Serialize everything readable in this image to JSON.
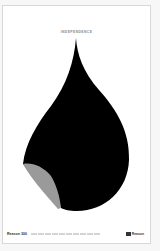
{
  "poster": {
    "title": "INDEPENDENCE",
    "artwork": {
      "subject": "ink-drop-with-peeling-corner",
      "drop_color": "#000000",
      "peel_color": "#9a9a9a",
      "background_color": "#ffffff"
    },
    "footer": {
      "left_label": "Reason 300",
      "fine_print": "",
      "right_logo_icon": "logo-mark-icon",
      "right_label": "Reason"
    }
  },
  "colors": {
    "page_background": "#f7f7f7",
    "frame_border": "#d8d8d8",
    "title_text": "#8a8a8a",
    "footer_text": "#333333"
  }
}
